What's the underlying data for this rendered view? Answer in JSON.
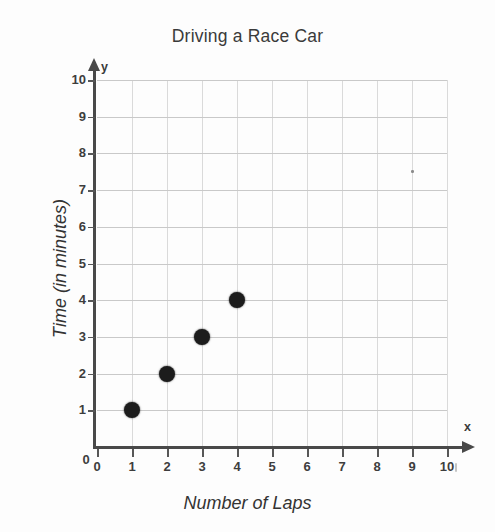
{
  "chart_data": {
    "type": "scatter",
    "title": "Driving a Race Car",
    "xlabel": "Number of Laps",
    "ylabel": "Time (in minutes)",
    "x_axis_symbol": "x",
    "y_axis_symbol": "y",
    "xlim": [
      0,
      10
    ],
    "ylim": [
      0,
      10
    ],
    "xticks": [
      0,
      1,
      2,
      3,
      4,
      5,
      6,
      7,
      8,
      9,
      10
    ],
    "yticks": [
      0,
      1,
      2,
      3,
      4,
      5,
      6,
      7,
      8,
      9,
      10
    ],
    "xticklabels": [
      "0",
      "1",
      "2",
      "3",
      "4",
      "5",
      "6",
      "7",
      "8",
      "9",
      "10"
    ],
    "yticklabels": [
      "0",
      "1",
      "2",
      "3",
      "4",
      "5",
      "6",
      "7",
      "8",
      "9",
      "10"
    ],
    "grid": true,
    "legend": false,
    "marker_color": "#1c1c1c",
    "grid_color": "#d2d2d2",
    "axis_color": "#494949",
    "points": [
      {
        "x": 1,
        "y": 1
      },
      {
        "x": 2,
        "y": 2
      },
      {
        "x": 3,
        "y": 3
      },
      {
        "x": 4,
        "y": 4
      }
    ],
    "series": [
      {
        "name": "Laps vs Time",
        "x": [
          1,
          2,
          3,
          4
        ],
        "values": [
          1,
          2,
          3,
          4
        ]
      }
    ]
  }
}
